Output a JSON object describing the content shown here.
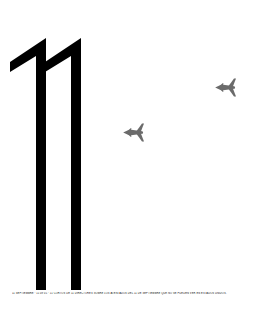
{
  "poster": {
    "background_color": "#ffffff",
    "numeral": {
      "text": "11",
      "color": "#000000",
      "description": "large-eleven-numeral"
    },
    "planes": [
      {
        "name": "airplane-silhouette-lower",
        "color": "#6b6b6b",
        "x": 133,
        "y": 132,
        "heading": "left"
      },
      {
        "name": "airplane-silhouette-upper",
        "color": "#6b6b6b",
        "x": 225,
        "y": 87,
        "heading": "left"
      }
    ],
    "caption": {
      "text": "11 SEPTIEMBRE · 11'09\"01 · 11 CORTOS DE 11 DIRECTORES SOBRE LOS ATENTADOS DEL 11 DE SEPTIEMBRE QUE NO SE PUEDEN VER EN ESTADOS UNIDOS.",
      "color": "#111111"
    }
  }
}
